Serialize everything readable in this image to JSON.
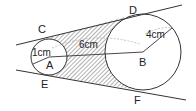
{
  "diagram": {
    "labels": {
      "C": "C",
      "D": "D",
      "E": "E",
      "F": "F",
      "A": "A",
      "B": "B",
      "r_small": "1cm",
      "distance": "6cm",
      "r_large": "4cm"
    },
    "colors": {
      "line": "#333333",
      "hatch": "#555555",
      "dashed": "#aaaaaa"
    }
  }
}
